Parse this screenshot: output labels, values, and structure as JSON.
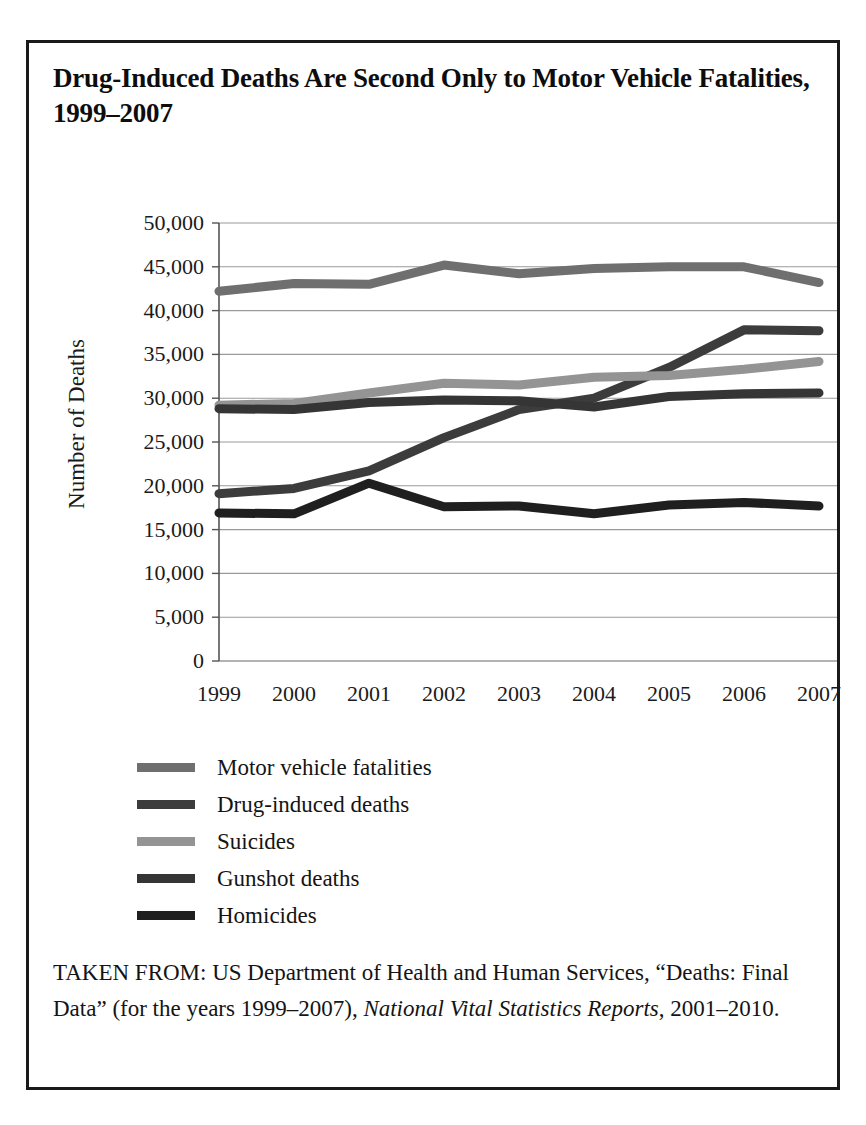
{
  "figure": {
    "title": "Drug-Induced Deaths Are Second Only to Motor Vehicle Fatalities, 1999–2007",
    "border_color": "#1a1a1a",
    "background": "#ffffff"
  },
  "source_note": {
    "lead": "TAKEN FROM: US Department of Health and Human Services, “Deaths: Final Data” (for the years 1999–2007), ",
    "italic_part": "National Vital Statistics Reports",
    "tail": ", 2001–2010."
  },
  "legend": {
    "position": "below-plot",
    "items": [
      {
        "label": "Motor vehicle fatalities",
        "color": "#6f6f6f"
      },
      {
        "label": "Drug-induced deaths",
        "color": "#3c3c3c"
      },
      {
        "label": "Suicides",
        "color": "#949494"
      },
      {
        "label": "Gunshot deaths",
        "color": "#353535"
      },
      {
        "label": "Homicides",
        "color": "#1f1f1f"
      }
    ]
  },
  "chart_data": {
    "type": "line",
    "title": "Drug-Induced Deaths Are Second Only to Motor Vehicle Fatalities, 1999–2007",
    "xlabel": "",
    "ylabel": "Number of Deaths",
    "x": [
      1999,
      2000,
      2001,
      2002,
      2003,
      2004,
      2005,
      2006,
      2007
    ],
    "categories": [
      "1999",
      "2000",
      "2001",
      "2002",
      "2003",
      "2004",
      "2005",
      "2006",
      "2007"
    ],
    "ylim": [
      0,
      50000
    ],
    "yticks": [
      0,
      5000,
      10000,
      15000,
      20000,
      25000,
      30000,
      35000,
      40000,
      45000,
      50000
    ],
    "ytick_labels": [
      "0",
      "5,000",
      "10,000",
      "15,000",
      "20,000",
      "25,000",
      "30,000",
      "35,000",
      "40,000",
      "45,000",
      "50,000"
    ],
    "grid": "horizontal",
    "legend_position": "below",
    "series": [
      {
        "name": "Motor vehicle fatalities",
        "color": "#6f6f6f",
        "values": [
          42200,
          43100,
          43000,
          45200,
          44200,
          44800,
          45000,
          45000,
          43200
        ]
      },
      {
        "name": "Drug-induced deaths",
        "color": "#3c3c3c",
        "values": [
          19100,
          19700,
          21700,
          25500,
          28700,
          30000,
          33500,
          37800,
          37700
        ]
      },
      {
        "name": "Suicides",
        "color": "#949494",
        "values": [
          29200,
          29400,
          30600,
          31700,
          31500,
          32400,
          32600,
          33300,
          34200
        ]
      },
      {
        "name": "Gunshot deaths",
        "color": "#353535",
        "values": [
          28800,
          28700,
          29500,
          29800,
          29700,
          29000,
          30200,
          30500,
          30600
        ]
      },
      {
        "name": "Homicides",
        "color": "#1f1f1f",
        "values": [
          16900,
          16800,
          20300,
          17600,
          17700,
          16800,
          17800,
          18100,
          17700
        ]
      }
    ]
  }
}
